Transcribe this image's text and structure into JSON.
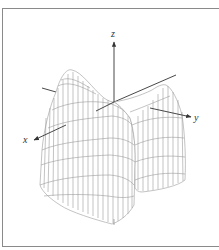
{
  "figure": {
    "type": "3d-surface-wireframe",
    "axes": {
      "x_label": "x",
      "y_label": "y",
      "z_label": "z"
    },
    "colors": {
      "border": "#8a8a8a",
      "mesh": "#9a9a9a",
      "axis": "#333333",
      "background": "#ffffff"
    }
  }
}
